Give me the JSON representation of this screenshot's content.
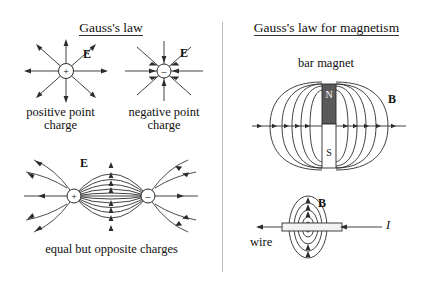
{
  "document": {
    "type": "physics-diagram",
    "background_color": "#ffffff",
    "ink_color": "#2c2c2c",
    "divider_color": "#b9b9b9"
  },
  "left_panel": {
    "title": "Gauss's law",
    "title_underlined": true,
    "items": [
      {
        "id": "positive-point-charge",
        "charge_symbol": "+",
        "field_label": "E",
        "caption": "positive point\ncharge",
        "field_direction": "outward",
        "ray_count": 8
      },
      {
        "id": "negative-point-charge",
        "charge_symbol": "–",
        "field_label": "E",
        "caption": "negative point\ncharge",
        "field_direction": "inward",
        "ray_count": 8
      },
      {
        "id": "electric-dipole",
        "positive_symbol": "+",
        "negative_symbol": "–",
        "field_label": "E",
        "caption": "equal but opposite charges",
        "field_direction": "positive-to-negative"
      }
    ]
  },
  "right_panel": {
    "title": "Gauss's law for magnetism",
    "title_underlined": true,
    "items": [
      {
        "id": "bar-magnet",
        "heading": "bar magnet",
        "north_pole_label": "N",
        "south_pole_label": "S",
        "north_pole_color": "#5a5a5a",
        "south_pole_color": "#ffffff",
        "field_label": "B",
        "field_direction": "closed-loops-N-to-S"
      },
      {
        "id": "current-carrying-wire",
        "field_label": "B",
        "current_label": "I",
        "wire_label": "wire",
        "field_direction": "circular-around-wire"
      }
    ]
  }
}
